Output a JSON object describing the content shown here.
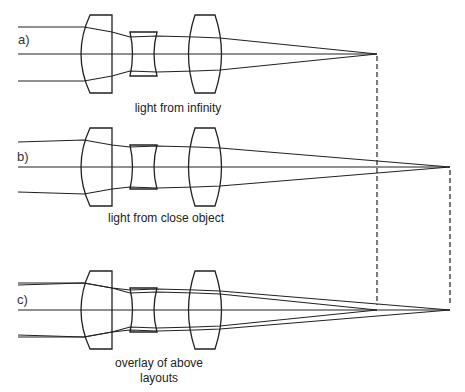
{
  "panels": [
    {
      "id": "a",
      "label": "a)",
      "caption": "light from infinity",
      "axis_y": 54,
      "focus_x": 377,
      "rays": "parallel"
    },
    {
      "id": "b",
      "label": "b)",
      "caption": "light from close object",
      "axis_y": 167,
      "focus_x": 450,
      "rays": "diverging"
    },
    {
      "id": "c",
      "label": "c)",
      "caption_line1": "overlay of above",
      "caption_line2": "layouts",
      "axis_y": 310,
      "focus_x": [
        377,
        450
      ],
      "rays": "overlay"
    }
  ],
  "colors": {
    "stroke": "#222222",
    "text": "#333333",
    "background": "#ffffff"
  }
}
